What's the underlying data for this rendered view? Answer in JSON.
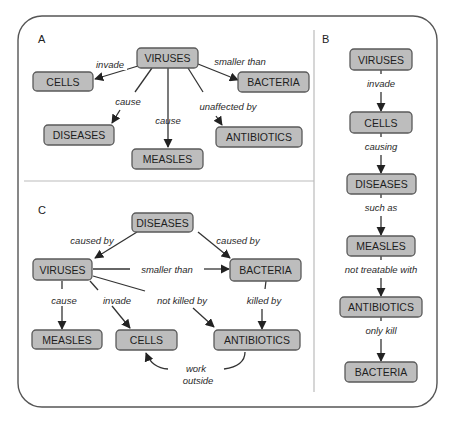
{
  "figure": {
    "panels": {
      "A": {
        "letter": "A",
        "nodes": {
          "viruses": "VIRUSES",
          "cells": "CELLS",
          "bacteria": "BACTERIA",
          "diseases": "DISEASES",
          "measles": "MEASLES",
          "antibiotics": "ANTIBIOTICS"
        },
        "links": {
          "invade": "invade",
          "smaller_than": "smaller than",
          "cause_diseases": "cause",
          "cause_measles": "cause",
          "unaffected_by": "unaffected by"
        }
      },
      "B": {
        "letter": "B",
        "nodes": [
          "VIRUSES",
          "CELLS",
          "DISEASES",
          "MEASLES",
          "ANTIBIOTICS",
          "BACTERIA"
        ],
        "links": [
          "invade",
          "causing",
          "such as",
          "not treatable with",
          "only kill"
        ]
      },
      "C": {
        "letter": "C",
        "nodes": {
          "diseases": "DISEASES",
          "viruses": "VIRUSES",
          "bacteria": "BACTERIA",
          "measles": "MEASLES",
          "cells": "CELLS",
          "antibiotics": "ANTIBIOTICS"
        },
        "links": {
          "caused_by_left": "caused by",
          "caused_by_right": "caused by",
          "smaller_than": "smaller than",
          "cause": "cause",
          "invade": "invade",
          "not_killed_by": "not killed by",
          "killed_by": "killed by",
          "work_line1": "work",
          "work_line2": "outside"
        }
      }
    },
    "colors": {
      "node_fill": "#bdbdbd",
      "node_border": "#5a5a5a",
      "edge": "#333333",
      "frame": "#555555",
      "divider": "#bbbbbb"
    }
  }
}
